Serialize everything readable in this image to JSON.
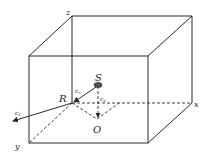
{
  "diagram": {
    "type": "3d-box-reflection",
    "labels": {
      "z_axis": "z",
      "x_axis": "x",
      "y_axis": "y",
      "source": "S",
      "reflection_point": "R",
      "origin": "O",
      "incident_speed": "c",
      "incident_sub": "r",
      "reflected_speed": "c",
      "reflected_sub": "1",
      "vertical_speed": "c",
      "vertical_sub": "o"
    },
    "colors": {
      "line": "#2a2a2a",
      "label": "#222222",
      "background": "#ffffff"
    }
  }
}
